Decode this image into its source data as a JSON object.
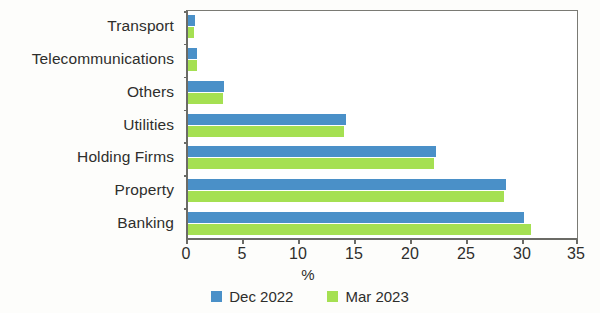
{
  "chart_data": {
    "type": "bar",
    "orientation": "horizontal",
    "title": "",
    "subtitle": "",
    "xlabel": "%",
    "ylabel": "",
    "xlim": [
      0,
      35
    ],
    "xticks": [
      0,
      5,
      10,
      15,
      20,
      25,
      30,
      35
    ],
    "xtick_labels": [
      "0",
      "5",
      "10",
      "15",
      "20",
      "25",
      "30",
      "35"
    ],
    "grid": false,
    "legend_position": "bottom-center",
    "categories": [
      "Transport",
      "Telecommunications",
      "Others",
      "Utilities",
      "Holding Firms",
      "Property",
      "Banking"
    ],
    "series": [
      {
        "name": "Dec 2022",
        "color": "#4a90c8",
        "values": [
          0.6,
          0.8,
          3.2,
          14.1,
          22.1,
          28.4,
          30.0
        ]
      },
      {
        "name": "Mar 2023",
        "color": "#a5e052",
        "values": [
          0.5,
          0.8,
          3.1,
          13.9,
          22.0,
          28.2,
          30.6
        ]
      }
    ]
  },
  "legend": {
    "items": [
      {
        "label": "Dec 2022",
        "color": "#4a90c8"
      },
      {
        "label": "Mar 2023",
        "color": "#a5e052"
      }
    ]
  },
  "axis": {
    "x_title": "%"
  }
}
